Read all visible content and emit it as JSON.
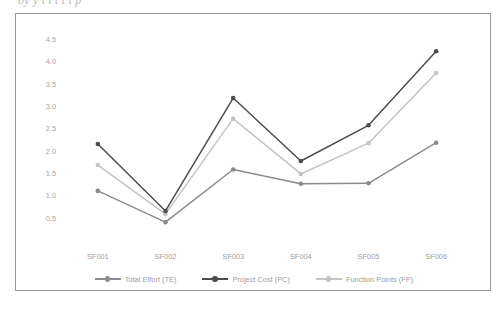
{
  "figure": {
    "title_sliver": "by  y   t          t    t        t    t                 p",
    "frame_color": "#9a9a9a",
    "background": "#ffffff"
  },
  "chart_data": {
    "type": "line",
    "title": "",
    "subtitle": "",
    "xlabel": "",
    "ylabel": "",
    "categories": [
      "SF001",
      "SF002",
      "SF003",
      "SF004",
      "SF005",
      "SF006"
    ],
    "x_tick_labels": [
      "SF001",
      "SF002",
      "SF003",
      "SF004",
      "SF005",
      "SF006"
    ],
    "y_tick_labels": [
      "0.5",
      "1.0",
      "1.5",
      "2.0",
      "2.5",
      "3.0",
      "3.5",
      "4.0",
      "4.5"
    ],
    "y_ticks": [
      0.5,
      1.0,
      1.5,
      2.0,
      2.5,
      3.0,
      3.5,
      4.0,
      4.5
    ],
    "ylim": [
      0.0,
      4.75
    ],
    "grid": false,
    "axis_lines": false,
    "legend_position": "bottom",
    "markers": true,
    "series": [
      {
        "name": "Total Effort (TE)",
        "color": "#8c8c8c",
        "values": [
          1.1,
          0.4,
          1.58,
          1.26,
          1.27,
          2.18
        ]
      },
      {
        "name": "Project Cost (PC)",
        "color": "#4d4d4d",
        "values": [
          2.15,
          0.65,
          3.18,
          1.77,
          2.57,
          4.23
        ]
      },
      {
        "name": "Function Points (FP)",
        "color": "#c4c4c4",
        "values": [
          1.68,
          0.58,
          2.72,
          1.48,
          2.17,
          3.74
        ]
      }
    ]
  },
  "legend": {
    "items": [
      {
        "label": "Total Effort (TE)",
        "color": "#8c8c8c"
      },
      {
        "label": "Project Cost (PC)",
        "color": "#4d4d4d"
      },
      {
        "label": "Function Points (FP)",
        "color": "#c4c4c4"
      }
    ]
  }
}
